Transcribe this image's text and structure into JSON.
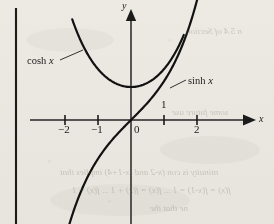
{
  "figure": {
    "kind": "math-plot",
    "background_color": "#f2f0ec",
    "ink_color": "#1c1c1c",
    "page_edge_line": {
      "name": "page-gutter-line",
      "x": 16,
      "y_top": 8,
      "y_bottom": 224
    },
    "axes": {
      "x_axis_label": "x",
      "y_axis_label": "y",
      "origin_label": "0",
      "origin_px": {
        "x": 131,
        "y": 120
      },
      "unit_px": 33,
      "x_range": [
        -3.4,
        3.0
      ],
      "y_range": [
        -3.1,
        2.8
      ],
      "x_ticks": [
        {
          "value": -2,
          "label": "-2",
          "label_side": "below"
        },
        {
          "value": -1,
          "label": "-1",
          "label_side": "below"
        },
        {
          "value": 1,
          "label": "1",
          "label_side": "above"
        },
        {
          "value": 2,
          "label": "2",
          "label_side": "below"
        }
      ],
      "y_ticks": [
        {
          "value": 1,
          "label": "",
          "label_side": "none"
        }
      ],
      "arrowheads": [
        "x-positive",
        "y-positive"
      ]
    },
    "curves": [
      {
        "name": "cosh-curve",
        "label": "cosh x",
        "function": "cosh",
        "label_position_px": {
          "x": 27,
          "y": 56
        },
        "leader_line_px": {
          "x1": 60,
          "y1": 60,
          "x2": 83,
          "y2": 50
        },
        "domain": [
          -1.78,
          1.6
        ],
        "stroke_width": 2.2
      },
      {
        "name": "sinh-curve",
        "label": "sinh x",
        "function": "sinh",
        "label_position_px": {
          "x": 188,
          "y": 76
        },
        "leader_line_px": {
          "x1": 170,
          "y1": 88,
          "x2": 186,
          "y2": 80
        },
        "domain": [
          -2.16,
          2.08
        ],
        "stroke_width": 2.2
      }
    ],
    "bleedthrough": [
      {
        "text": "n 5.4 of Section",
        "x": 186,
        "y": 27
      },
      {
        "text": "some future use",
        "x": 172,
        "y": 108
      },
      {
        "text": "ntinuity is con (x-2  and (x-1+4) implies that",
        "x": 60,
        "y": 168
      },
      {
        "text": "f(x) = f(x-1) = 1 ... f(x) = f(x) + 1 ... f(x) = 1",
        "x": 72,
        "y": 186
      },
      {
        "text": "ne that the",
        "x": 150,
        "y": 204
      }
    ]
  }
}
